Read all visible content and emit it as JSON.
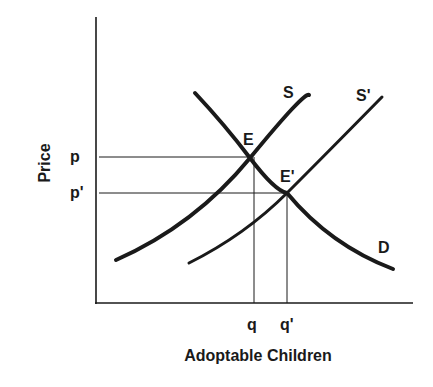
{
  "diagram": {
    "type": "supply-demand",
    "axes": {
      "x_label": "Adoptable Children",
      "y_label": "Price"
    },
    "curves": [
      {
        "id": "S",
        "label": "S",
        "kind": "supply"
      },
      {
        "id": "S_prime",
        "label": "S'",
        "kind": "supply-shifted"
      },
      {
        "id": "D",
        "label": "D",
        "kind": "demand"
      }
    ],
    "equilibria": [
      {
        "label": "E",
        "price_label": "p",
        "quantity_label": "q"
      },
      {
        "label": "E'",
        "price_label": "p'",
        "quantity_label": "q'"
      }
    ],
    "colors": {
      "ink": "#1a1a1a",
      "background": "#ffffff"
    }
  }
}
